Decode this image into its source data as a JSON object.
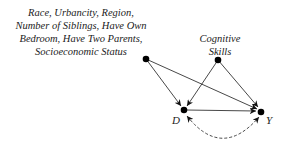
{
  "nodes": {
    "confounders": {
      "label_lines": [
        "Race, Urbancity, Region,",
        "Number of Siblings, Have Own",
        "Bedroom, Have Two Parents,",
        "Socioeconomic Status"
      ]
    },
    "cognitive": {
      "label_lines": [
        "Cognitive",
        "Skills"
      ]
    },
    "treatment": {
      "label": "D"
    },
    "outcome": {
      "label": "Y"
    }
  },
  "edges": [
    {
      "from": "confounders",
      "to": "D",
      "style": "solid"
    },
    {
      "from": "confounders",
      "to": "Y",
      "style": "solid"
    },
    {
      "from": "cognitive",
      "to": "D",
      "style": "solid"
    },
    {
      "from": "cognitive",
      "to": "Y",
      "style": "solid"
    },
    {
      "from": "D",
      "to": "Y",
      "style": "solid"
    },
    {
      "from": "D",
      "to": "Y",
      "style": "dashed-bidirected"
    }
  ]
}
